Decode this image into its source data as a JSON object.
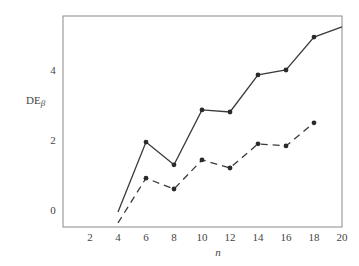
{
  "chart_data": {
    "type": "line",
    "title": "",
    "xlabel": "n",
    "ylabel": "DE",
    "ylabel_subscript": "β",
    "xlim": [
      0,
      20
    ],
    "ylim": [
      -0.49,
      5.54
    ],
    "xticks": [
      2,
      4,
      6,
      8,
      10,
      12,
      14,
      16,
      18,
      20
    ],
    "yticks": [
      0,
      2,
      4
    ],
    "grid": false,
    "legend": null,
    "series": [
      {
        "name": "solid",
        "style": "solid",
        "x": [
          4,
          6,
          8,
          10,
          12,
          14,
          16,
          18,
          20
        ],
        "y": [
          -0.06,
          1.94,
          1.29,
          2.86,
          2.8,
          3.86,
          4.0,
          4.94,
          5.23
        ],
        "markers": [
          false,
          true,
          true,
          true,
          true,
          true,
          true,
          true,
          false
        ]
      },
      {
        "name": "dashed",
        "style": "dashed",
        "x": [
          4,
          6,
          8,
          10,
          12,
          14,
          16,
          18
        ],
        "y": [
          -0.37,
          0.91,
          0.6,
          1.43,
          1.2,
          1.89,
          1.83,
          2.49
        ],
        "markers": [
          false,
          true,
          true,
          true,
          true,
          true,
          true,
          true
        ]
      }
    ]
  },
  "colors": {
    "frame": "#8a8a8a",
    "line": "#3a3a3a",
    "marker": "#2a2a2a",
    "text": "#444444"
  }
}
